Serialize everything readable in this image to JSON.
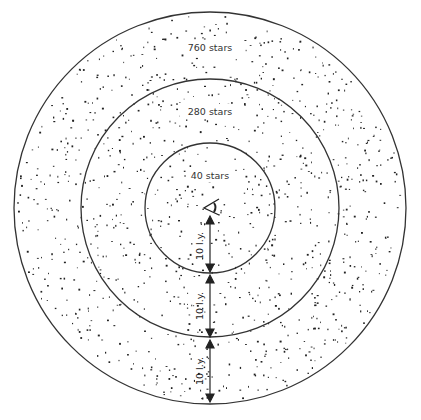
{
  "diagram": {
    "center": {
      "x": 210,
      "y": 208
    },
    "rings": [
      {
        "label": "40 stars",
        "radius": 65,
        "stars": 40
      },
      {
        "label": "280 stars",
        "radius": 129,
        "stars": 280
      },
      {
        "label": "760 stars",
        "radius": 196,
        "stars": 760
      }
    ],
    "distance_labels": [
      "10 l.y.",
      "10 l.y.",
      "10 l.y."
    ],
    "observer_icon": "eye-icon",
    "colors": {
      "line": "#333333",
      "star": "#222222",
      "background": "#ffffff"
    }
  }
}
